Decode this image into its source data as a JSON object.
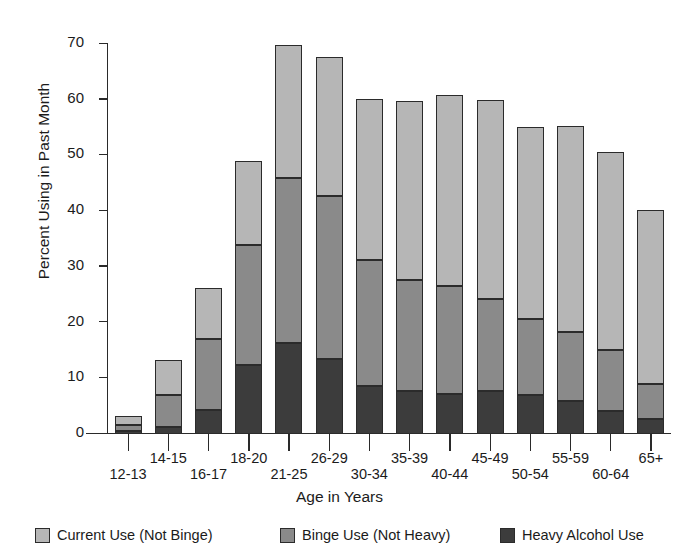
{
  "figure": {
    "clipped_caption": "",
    "x_axis_title": "Age in Years",
    "y_axis_title": "Percent Using in Past Month"
  },
  "legend": {
    "position": "bottom",
    "items": [
      {
        "label": "Current Use (Not Binge)",
        "color": "#b6b6b6",
        "key": "current"
      },
      {
        "label": "Binge Use (Not Heavy)",
        "color": "#8a8a8a",
        "key": "binge"
      },
      {
        "label": "Heavy Alcohol Use",
        "color": "#3c3c3c",
        "key": "heavy"
      }
    ]
  },
  "chart_data": {
    "type": "bar",
    "stacked": true,
    "title": "",
    "xlabel": "Age in Years",
    "ylabel": "Percent Using in Past Month",
    "ylim": [
      0,
      70
    ],
    "yticks": [
      0,
      10,
      20,
      30,
      40,
      50,
      60,
      70
    ],
    "ytick_labels": [
      "0",
      "10",
      "20",
      "30",
      "40",
      "50",
      "60",
      "70"
    ],
    "grid": false,
    "legend_position": "bottom",
    "categories": [
      "12-13",
      "14-15",
      "16-17",
      "18-20",
      "21-25",
      "26-29",
      "30-34",
      "35-39",
      "40-44",
      "45-49",
      "50-54",
      "55-59",
      "60-64",
      "65+"
    ],
    "series": [
      {
        "name": "Heavy Alcohol Use",
        "color": "#3c3c3c",
        "values": [
          0.6,
          1.2,
          4.4,
          12.3,
          16.3,
          13.4,
          8.6,
          7.8,
          7.2,
          7.8,
          7.0,
          5.9,
          4.1,
          2.7
        ]
      },
      {
        "name": "Binge Use (Not Heavy)",
        "color": "#8a8a8a",
        "values": [
          1.1,
          5.8,
          12.7,
          21.7,
          29.7,
          29.3,
          22.6,
          19.8,
          19.4,
          16.4,
          13.6,
          12.4,
          11.0,
          6.2
        ]
      },
      {
        "name": "Current Use (Not Binge)",
        "color": "#b6b6b6",
        "values": [
          1.6,
          6.2,
          9.1,
          15.0,
          23.8,
          24.9,
          29.0,
          32.2,
          34.2,
          35.8,
          34.5,
          36.9,
          35.6,
          31.3
        ]
      }
    ],
    "totals": [
      3.3,
      13.2,
      26.2,
      49.0,
      69.8,
      67.6,
      60.2,
      59.8,
      60.8,
      60.0,
      55.1,
      55.2,
      50.7,
      40.2
    ],
    "cumulative_boundaries": {
      "heavy_top": [
        0.6,
        1.2,
        4.4,
        12.3,
        16.3,
        13.4,
        8.6,
        7.8,
        7.2,
        7.8,
        7.0,
        5.9,
        4.1,
        2.7
      ],
      "binge_top": [
        1.7,
        7.0,
        17.1,
        34.0,
        46.0,
        42.7,
        31.2,
        27.6,
        26.6,
        24.2,
        20.6,
        18.3,
        15.1,
        8.9
      ]
    }
  },
  "colors": {
    "axis": "#2a2a2a",
    "text": "#1b1b1b",
    "background": "#ffffff",
    "current_use": "#b6b6b6",
    "binge_use": "#8a8a8a",
    "heavy_use": "#3c3c3c"
  }
}
